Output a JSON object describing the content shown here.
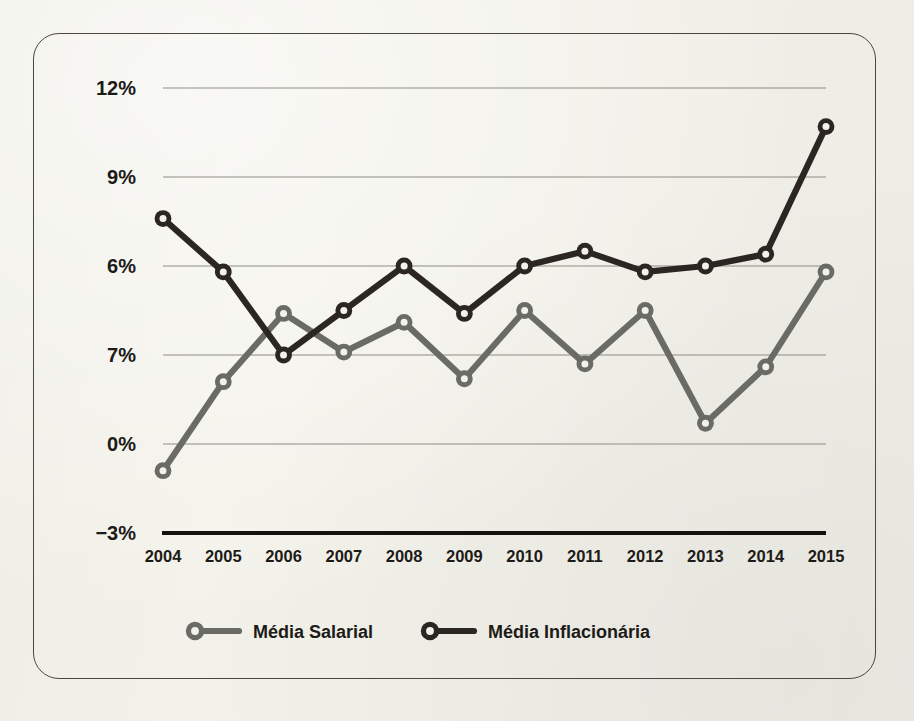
{
  "chart_data": {
    "type": "line",
    "title": "",
    "subtitle": "",
    "xlabel": "",
    "ylabel": "",
    "categories": [
      "2004",
      "2005",
      "2006",
      "2007",
      "2008",
      "2009",
      "2010",
      "2011",
      "2012",
      "2013",
      "2014",
      "2015"
    ],
    "x": [
      2004,
      2005,
      2006,
      2007,
      2008,
      2009,
      2010,
      2011,
      2012,
      2013,
      2014,
      2015
    ],
    "series": [
      {
        "name": "Média Salarial",
        "color": "#6b6b66",
        "values": [
          -0.9,
          2.1,
          4.4,
          3.1,
          4.1,
          2.2,
          4.5,
          2.7,
          4.5,
          0.7,
          2.6,
          5.8
        ]
      },
      {
        "name": "Média Inflacionária",
        "color": "#2b2622",
        "values": [
          7.6,
          5.8,
          3.0,
          4.5,
          6.0,
          4.4,
          6.0,
          6.5,
          5.8,
          6.0,
          6.4,
          10.7
        ]
      }
    ],
    "ylim": [
      -3,
      12
    ],
    "ytick_values": [
      12,
      9,
      6,
      3,
      0,
      -3
    ],
    "ytick_labels": [
      "12%",
      "9%",
      "6%",
      "7%",
      "0%",
      "−3%"
    ],
    "grid": true,
    "grid_axis": "y",
    "legend_position": "bottom",
    "axis_baseline_value": -3,
    "note": "The fourth y-axis tick is printed as \"7%\" in the source although it sits at the 3% gridline position."
  },
  "axis": {
    "y_labels": [
      "12%",
      "9%",
      "6%",
      "7%",
      "0%",
      "−3%"
    ],
    "x_labels": [
      "2004",
      "2005",
      "2006",
      "2007",
      "2008",
      "2009",
      "2010",
      "2011",
      "2012",
      "2013",
      "2014",
      "2015"
    ]
  },
  "legend": {
    "items": [
      {
        "label": "Média Salarial",
        "color": "#6b6b66",
        "marker": "ring-marker"
      },
      {
        "label": "Média Inflacionária",
        "color": "#2b2622",
        "marker": "ring-marker"
      }
    ]
  },
  "colors": {
    "paper": "#f3f2ea",
    "frame": "#4a4740",
    "grid": "#8e8c84",
    "axis": "#141210",
    "text": "#1d1b18",
    "series_salarial": "#6b6b66",
    "series_inflacionaria": "#2b2622"
  }
}
